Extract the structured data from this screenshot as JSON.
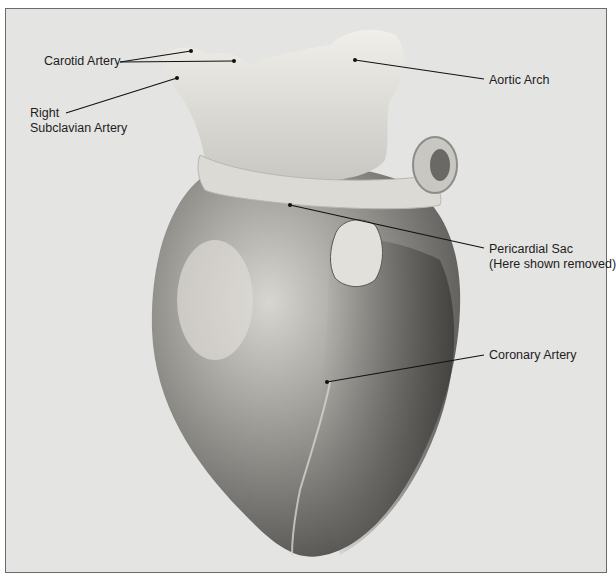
{
  "figure": {
    "colors": {
      "background": "#e4e4e2",
      "border": "#6b6b6b",
      "label_text": "#1d1d1d",
      "leader_line": "#111111"
    }
  },
  "labels": {
    "carotid_artery": "Carotid Artery",
    "right_subclavian_line1": "Right",
    "right_subclavian_line2": "Subclavian Artery",
    "aortic_arch": "Aortic Arch",
    "pericardial_sac_line1": "Pericardial Sac",
    "pericardial_sac_line2": "(Here shown removed)",
    "coronary_artery": "Coronary Artery"
  }
}
